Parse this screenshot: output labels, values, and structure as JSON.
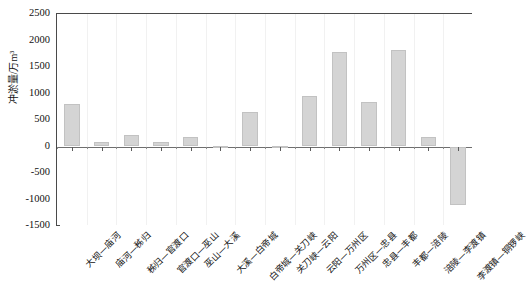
{
  "chart_data": {
    "type": "bar",
    "title": "",
    "xlabel": "",
    "ylabel": "冲淤量/万m³",
    "ylim": [
      -1500,
      2500
    ],
    "ytick_values": [
      2500,
      2000,
      1500,
      1000,
      500,
      0,
      -500,
      -1000,
      -1500
    ],
    "ytick_labels": [
      "2500",
      "2000",
      "1500",
      "1000",
      "500",
      "0",
      "-500",
      "-1000",
      "-1500"
    ],
    "grid": false,
    "legend": "none",
    "categories": [
      "大坝—庙河",
      "庙河—秭归",
      "秭归—官渡口",
      "官渡口—巫山",
      "巫山—大溪",
      "大溪—白帝城",
      "白帝城—关刀峡",
      "关刀峡—云阳",
      "云阳—万州区",
      "万州区—忠县",
      "忠县—丰都",
      "丰都—涪陵",
      "涪陵—李渡镇",
      "李渡镇—铜锣峡"
    ],
    "values": [
      800,
      90,
      210,
      80,
      170,
      15,
      660,
      10,
      950,
      1790,
      840,
      1830,
      170,
      -1100
    ],
    "bar_color": "#d4d4d4",
    "bar_edge_color": "#c2c2c2",
    "axis_color": "#4a4a4a"
  }
}
